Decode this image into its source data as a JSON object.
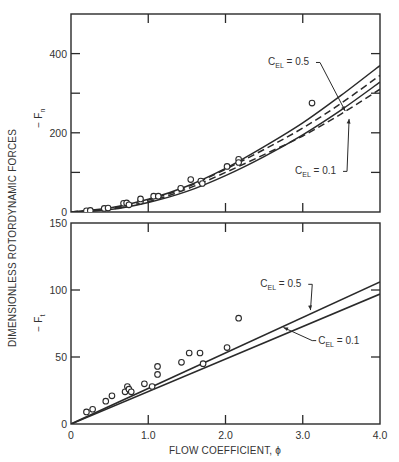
{
  "chart_data": [
    {
      "type": "scatter",
      "panel": "top",
      "title": "",
      "xlabel": "FLOW COEFFICIENT, ϕ",
      "ylabel": "− F_n",
      "shared_ylabel": "DIMENSIONLESS ROTORDYNAMIC FORCES",
      "xlim": [
        0,
        4.0
      ],
      "ylim": [
        0,
        500
      ],
      "y_ticks": [
        0,
        100,
        200,
        300,
        400,
        500
      ],
      "y_tick_labels": [
        "0",
        "",
        "200",
        "",
        "400",
        ""
      ],
      "x_ticks": [
        0,
        1.0,
        2.0,
        3.0,
        4.0
      ],
      "grid": false,
      "points": [
        {
          "x": 0.2,
          "y": 3
        },
        {
          "x": 0.25,
          "y": 4
        },
        {
          "x": 0.43,
          "y": 9
        },
        {
          "x": 0.48,
          "y": 10
        },
        {
          "x": 0.68,
          "y": 22
        },
        {
          "x": 0.72,
          "y": 23
        },
        {
          "x": 0.75,
          "y": 18
        },
        {
          "x": 0.9,
          "y": 27
        },
        {
          "x": 0.9,
          "y": 33
        },
        {
          "x": 1.07,
          "y": 40
        },
        {
          "x": 1.13,
          "y": 40
        },
        {
          "x": 1.42,
          "y": 60
        },
        {
          "x": 1.55,
          "y": 82
        },
        {
          "x": 1.68,
          "y": 78
        },
        {
          "x": 1.7,
          "y": 72
        },
        {
          "x": 2.02,
          "y": 115
        },
        {
          "x": 2.17,
          "y": 133
        },
        {
          "x": 2.17,
          "y": 125
        },
        {
          "x": 3.12,
          "y": 275
        }
      ],
      "series": [
        {
          "name": "C_EL = 0.5 (solid)",
          "style": "solid",
          "x": [
            0,
            0.5,
            1.0,
            1.5,
            2.0,
            2.5,
            3.0,
            3.5,
            4.0
          ],
          "values": [
            0,
            10,
            32,
            65,
            110,
            165,
            225,
            295,
            370
          ]
        },
        {
          "name": "C_EL = 0.5 (dashed)",
          "style": "dashed",
          "x": [
            0,
            0.5,
            1.0,
            1.5,
            2.0,
            2.5,
            3.0,
            3.5,
            4.0
          ],
          "values": [
            0,
            9,
            30,
            63,
            108,
            158,
            212,
            275,
            345
          ]
        },
        {
          "name": "C_EL = 0.1 (solid)",
          "style": "solid",
          "x": [
            0,
            0.5,
            1.0,
            1.5,
            2.0,
            2.5,
            3.0,
            3.5,
            4.0
          ],
          "values": [
            0,
            6,
            24,
            52,
            92,
            140,
            195,
            258,
            328
          ]
        },
        {
          "name": "C_EL = 0.1 (dashed)",
          "style": "dashed",
          "x": [
            0,
            0.5,
            1.0,
            1.5,
            2.0,
            2.5,
            3.0,
            3.5,
            4.0
          ],
          "values": [
            0,
            7,
            26,
            58,
            100,
            145,
            192,
            248,
            310
          ]
        }
      ],
      "annotations": [
        {
          "text_main": "C",
          "text_sub": "EL",
          "text_rest": " = 0.5",
          "x": 2.55,
          "y": 370,
          "arrow_to": {
            "x": 3.55,
            "y": 255
          }
        },
        {
          "text_main": "C",
          "text_sub": "EL",
          "text_rest": " = 0.1",
          "x": 2.9,
          "y": 95,
          "arrow_to": {
            "x": 3.6,
            "y": 235
          }
        }
      ]
    },
    {
      "type": "scatter",
      "panel": "bottom",
      "title": "",
      "xlabel": "FLOW COEFFICIENT, ϕ",
      "ylabel": "− F_t",
      "xlim": [
        0,
        4.0
      ],
      "ylim": [
        0,
        150
      ],
      "y_ticks": [
        0,
        50,
        100,
        150
      ],
      "y_tick_labels": [
        "0",
        "50",
        "100",
        "150"
      ],
      "x_ticks": [
        0,
        1.0,
        2.0,
        3.0,
        4.0
      ],
      "x_tick_labels": [
        "0",
        "1.0",
        "2.0",
        "3.0",
        "4.0"
      ],
      "grid": false,
      "points": [
        {
          "x": 0.2,
          "y": 9
        },
        {
          "x": 0.28,
          "y": 11
        },
        {
          "x": 0.45,
          "y": 17
        },
        {
          "x": 0.53,
          "y": 21
        },
        {
          "x": 0.7,
          "y": 24
        },
        {
          "x": 0.73,
          "y": 28
        },
        {
          "x": 0.75,
          "y": 26
        },
        {
          "x": 0.78,
          "y": 24
        },
        {
          "x": 0.95,
          "y": 30
        },
        {
          "x": 1.05,
          "y": 28
        },
        {
          "x": 1.12,
          "y": 37
        },
        {
          "x": 1.12,
          "y": 43
        },
        {
          "x": 1.43,
          "y": 46
        },
        {
          "x": 1.53,
          "y": 53
        },
        {
          "x": 1.67,
          "y": 53
        },
        {
          "x": 1.71,
          "y": 45
        },
        {
          "x": 2.02,
          "y": 57
        },
        {
          "x": 2.17,
          "y": 79
        }
      ],
      "series": [
        {
          "name": "C_EL = 0.5",
          "style": "solid",
          "x": [
            0,
            4.0
          ],
          "values": [
            0,
            106
          ]
        },
        {
          "name": "C_EL = 0.1",
          "style": "solid",
          "x": [
            0,
            4.0
          ],
          "values": [
            0,
            97
          ]
        }
      ],
      "annotations": [
        {
          "text_main": "C",
          "text_sub": "EL",
          "text_rest": " = 0.5",
          "x": 2.45,
          "y": 102,
          "arrow_to": {
            "x": 3.1,
            "y": 85
          }
        },
        {
          "text_main": "C",
          "text_sub": "EL",
          "text_rest": " = 0.1",
          "x": 3.2,
          "y": 60,
          "arrow_to": {
            "x": 2.75,
            "y": 72
          }
        }
      ]
    }
  ],
  "labels": {
    "shared_ylabel": "DIMENSIONLESS ROTORDYNAMIC FORCES",
    "top_ylabel_main": "− F",
    "top_ylabel_sub": "n",
    "bottom_ylabel_main": "− F",
    "bottom_ylabel_sub": "t",
    "xlabel": "FLOW COEFFICIENT, ϕ"
  }
}
